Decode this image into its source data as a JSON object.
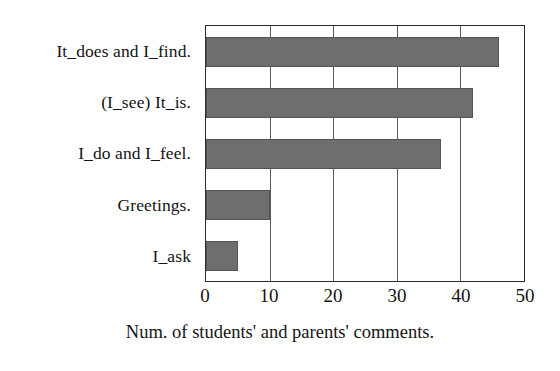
{
  "chart_data": {
    "type": "bar",
    "orientation": "horizontal",
    "title": "",
    "subtitle": "",
    "xlabel": "Num. of students' and parents' comments.",
    "ylabel": "",
    "categories": [
      "It_does and I_find.",
      "(I_see) It_is.",
      "I_do and I_feel.",
      "Greetings.",
      "I_ask"
    ],
    "values": [
      46,
      42,
      37,
      10,
      5
    ],
    "series": [
      {
        "name": "Num. of students' and parents' comments.",
        "values": [
          46,
          42,
          37,
          10,
          5
        ]
      }
    ],
    "xlim": [
      0,
      50
    ],
    "xticks": [
      0,
      10,
      20,
      30,
      40,
      50
    ],
    "xtick_labels": [
      "0",
      "10",
      "20",
      "30",
      "40",
      "50"
    ],
    "grid": true,
    "grid_axis": "x",
    "legend": false,
    "legend_position": "none",
    "annotations": [],
    "colors": {
      "bar_fill": "#6e6e6e",
      "bar_edge": "#545454",
      "plot_border": "#2b2b2b",
      "gridline": "#5a5a5a",
      "text": "#141414",
      "background": "#ffffff"
    }
  }
}
